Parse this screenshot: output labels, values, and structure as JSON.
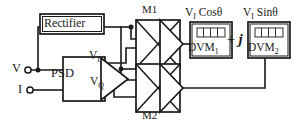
{
  "diagram": {
    "colors": {
      "stroke": "#1a1a1a",
      "fill": "#ffffff",
      "background": "#ffffff"
    },
    "blocks": {
      "rectifier": {
        "label": "Rectifier"
      },
      "psd": {
        "label": "PSD"
      },
      "mixer_1": {
        "label": "M1"
      },
      "mixer_2": {
        "label": "M2"
      },
      "dvm_1": {
        "label": "DVM",
        "subscript": "1"
      },
      "dvm_2": {
        "label": "DVM",
        "subscript": "2"
      }
    },
    "terminals": {
      "voltage_input": {
        "label": "V"
      },
      "current_input": {
        "label": "I"
      }
    },
    "signals": {
      "psd_inphase": {
        "label": "V",
        "subscript": "I"
      },
      "psd_quadrature": {
        "label": "V",
        "subscript": "Q"
      }
    },
    "outputs": {
      "dvm1_quantity": {
        "prefix": "V",
        "subscript": "I",
        "expression": "Cosθ"
      },
      "dvm2_quantity": {
        "prefix": "V",
        "subscript": "I",
        "expression": "Sinθ"
      },
      "combiner": {
        "operator": "+",
        "imaginary_unit": "j"
      }
    }
  }
}
